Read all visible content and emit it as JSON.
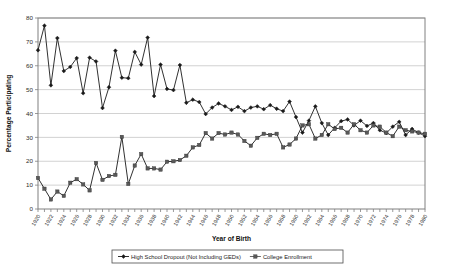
{
  "chart_data": {
    "type": "line",
    "title": "",
    "xlabel": "Year of Birth",
    "ylabel": "Percentage Participating",
    "ylim": [
      0,
      80
    ],
    "ytick_step": 10,
    "yticks": [
      0,
      10,
      20,
      30,
      40,
      50,
      60,
      70,
      80
    ],
    "xlim": [
      1920,
      1980
    ],
    "xtick_step": 2,
    "xticks": [
      1920,
      1922,
      1924,
      1926,
      1928,
      1930,
      1932,
      1934,
      1936,
      1938,
      1940,
      1942,
      1944,
      1946,
      1948,
      1950,
      1952,
      1954,
      1956,
      1958,
      1960,
      1962,
      1964,
      1966,
      1968,
      1970,
      1972,
      1974,
      1976,
      1978,
      1980
    ],
    "grid": "horizontal",
    "legend_position": "below-axis-centered",
    "x": [
      1920,
      1921,
      1922,
      1923,
      1924,
      1925,
      1926,
      1927,
      1928,
      1929,
      1930,
      1931,
      1932,
      1933,
      1934,
      1935,
      1936,
      1937,
      1938,
      1939,
      1940,
      1941,
      1942,
      1943,
      1944,
      1945,
      1946,
      1947,
      1948,
      1949,
      1950,
      1951,
      1952,
      1953,
      1954,
      1955,
      1956,
      1957,
      1958,
      1959,
      1960,
      1961,
      1962,
      1963,
      1964,
      1965,
      1966,
      1967,
      1968,
      1969,
      1970,
      1971,
      1972,
      1973,
      1974,
      1975,
      1976,
      1977,
      1978,
      1979,
      1980
    ],
    "series": [
      {
        "name": "High School Dropout (Not Including GEDs)",
        "marker": "diamond",
        "color": "#1a1a1a",
        "values": [
          66.5,
          76.8,
          51.8,
          71.6,
          57.8,
          59.5,
          63.2,
          48.5,
          63.4,
          61.8,
          42.3,
          51.0,
          66.3,
          55.0,
          54.8,
          65.8,
          60.5,
          71.8,
          47.3,
          60.5,
          50.3,
          49.8,
          60.3,
          44.5,
          45.8,
          44.8,
          39.8,
          42.5,
          44.2,
          43.0,
          41.5,
          42.8,
          41.0,
          42.5,
          43.0,
          41.8,
          43.5,
          42.0,
          41.0,
          45.0,
          38.5,
          32.0,
          37.0,
          43.0,
          36.0,
          31.0,
          34.0,
          36.8,
          37.5,
          35.0,
          37.0,
          34.8,
          36.0,
          33.0,
          31.8,
          34.5,
          36.5,
          31.0,
          33.5,
          32.0,
          30.5
        ]
      },
      {
        "name": "College Enrollment",
        "marker": "square",
        "color": "#595959",
        "values": [
          13.0,
          8.5,
          4.0,
          7.3,
          5.5,
          11.0,
          12.5,
          10.3,
          7.8,
          19.3,
          12.2,
          13.8,
          14.3,
          30.2,
          10.5,
          18.2,
          23.0,
          17.0,
          17.0,
          16.5,
          19.8,
          20.0,
          20.5,
          22.3,
          25.8,
          26.8,
          31.8,
          29.5,
          31.8,
          31.2,
          32.0,
          31.2,
          28.5,
          26.5,
          29.8,
          31.5,
          31.0,
          31.5,
          25.8,
          27.0,
          29.5,
          35.0,
          35.5,
          29.5,
          31.0,
          35.5,
          33.5,
          34.0,
          32.0,
          35.5,
          33.0,
          32.0,
          35.0,
          34.5,
          32.0,
          30.5,
          34.5,
          33.0,
          32.5,
          32.0,
          31.5
        ]
      }
    ]
  },
  "legend": {
    "entries": [
      {
        "label": "High School Dropout (Not Including GEDs)"
      },
      {
        "label": "College Enrollment"
      }
    ]
  }
}
